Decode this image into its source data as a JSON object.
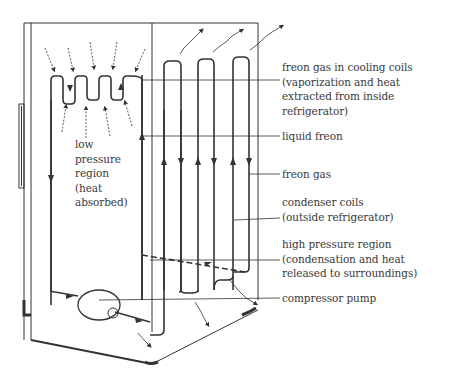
{
  "diagram": {
    "labels": {
      "cooling_coils": "freon gas in cooling coils\n(vaporization and heat\nextracted from inside\nrefrigerator)",
      "liquid_freon": "liquid freon",
      "freon_gas": "freon gas",
      "condenser_coils": "condenser coils\n(outside refrigerator)",
      "high_pressure": "high pressure region\n(condensation and heat\nreleased to surroundings)",
      "compressor": "compressor pump",
      "low_pressure": "low\npressure\nregion\n(heat\nabsorbed)"
    },
    "colors": {
      "line": "#3a3a3a",
      "text": "#3a3a3a",
      "background": "#ffffff"
    }
  }
}
